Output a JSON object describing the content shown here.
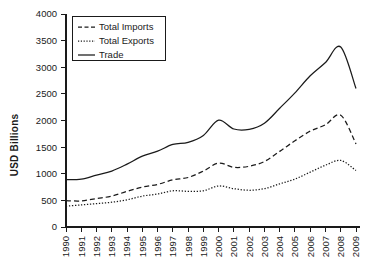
{
  "chart_data": {
    "type": "line",
    "title": "",
    "xlabel": "",
    "ylabel": "USD Billions",
    "grid": false,
    "legend_position": "top-left",
    "ylim": [
      0,
      4000
    ],
    "ytick_step": 500,
    "yticks": [
      "0",
      "500",
      "1000",
      "1500",
      "2000",
      "2500",
      "3000",
      "3500",
      "4000"
    ],
    "categories": [
      "1990",
      "1991",
      "1992",
      "1993",
      "1994",
      "1995",
      "1996",
      "1997",
      "1998",
      "1999",
      "2000",
      "2001",
      "2002",
      "2003",
      "2004",
      "2005",
      "2006",
      "2007",
      "2008",
      "2009"
    ],
    "x": [
      1990,
      1991,
      1992,
      1993,
      1994,
      1995,
      1996,
      1997,
      1998,
      1999,
      2000,
      2001,
      2002,
      2003,
      2004,
      2005,
      2006,
      2007,
      2008,
      2009
    ],
    "series": [
      {
        "name": "Total Imports",
        "style": "dashed",
        "values": [
          495,
          490,
          535,
          580,
          670,
          750,
          800,
          885,
          930,
          1050,
          1200,
          1120,
          1140,
          1230,
          1420,
          1620,
          1800,
          1920,
          2100,
          1560
        ]
      },
      {
        "name": "Total Exports",
        "style": "dotted",
        "values": [
          390,
          415,
          440,
          465,
          510,
          580,
          620,
          680,
          670,
          680,
          770,
          720,
          690,
          720,
          810,
          900,
          1030,
          1160,
          1250,
          1060
        ]
      },
      {
        "name": "Trade",
        "style": "solid",
        "values": [
          890,
          900,
          975,
          1050,
          1180,
          1330,
          1425,
          1550,
          1590,
          1720,
          2005,
          1840,
          1835,
          1950,
          2230,
          2520,
          2840,
          3090,
          3380,
          2600
        ]
      }
    ]
  },
  "legend": {
    "items": [
      {
        "label": "Total Imports",
        "style": "dashed"
      },
      {
        "label": "Total Exports",
        "style": "dotted"
      },
      {
        "label": "Trade",
        "style": "solid"
      }
    ]
  },
  "axes": {
    "y_axis_title": "USD Billions"
  }
}
